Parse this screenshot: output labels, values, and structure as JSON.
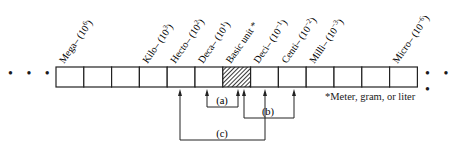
{
  "diagram": {
    "cells": [
      {
        "label": "Mega– (10",
        "exp": "6",
        "close": ")"
      },
      {
        "label": "",
        "exp": "",
        "close": ""
      },
      {
        "label": "",
        "exp": "",
        "close": ""
      },
      {
        "label": "Kilo– (10",
        "exp": "3",
        "close": ")"
      },
      {
        "label": "Hecto– (10",
        "exp": "2",
        "close": ")"
      },
      {
        "label": "Deca– (10",
        "exp": "1",
        "close": ")"
      },
      {
        "label": "Basic unit *",
        "exp": "",
        "close": "",
        "basic": true
      },
      {
        "label": "Deci– (10",
        "exp": "−1",
        "close": ")"
      },
      {
        "label": "Centi– (10",
        "exp": "−2",
        "close": ")"
      },
      {
        "label": "Milli– (10",
        "exp": "−3",
        "close": ")"
      },
      {
        "label": "",
        "exp": "",
        "close": ""
      },
      {
        "label": "",
        "exp": "",
        "close": ""
      },
      {
        "label": "Micro– (10",
        "exp": "−6",
        "close": ")"
      }
    ],
    "ellipsis_left": "• • •",
    "ellipsis_right": "• • •",
    "brackets": [
      {
        "label": "(a)",
        "from_cell": 5,
        "to_cell": 6
      },
      {
        "label": "(b)",
        "from_cell": 6,
        "to_cell": 8
      },
      {
        "label": "(c)",
        "from_cell": 3,
        "to_cell": 6
      }
    ],
    "footnote": "*Meter, gram, or liter"
  }
}
